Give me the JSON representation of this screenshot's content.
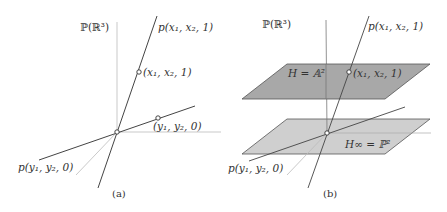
{
  "colors": {
    "line_dark": "#444444",
    "line_light": "#bbbbbb",
    "plane_upper": "#a8a8a8",
    "plane_lower": "#cfcfcf",
    "plane_edge": "#555555"
  },
  "panel_a": {
    "space_label": "ℙ(ℝ³)",
    "line_point_label": "p(x₁, x₂, 1)",
    "point_label": "(x₁, x₂, 1)",
    "point_inf_label": "(y₁, y₂, 0)",
    "line_inf_label": "p(y₁, y₂, 0)",
    "caption": "(a)"
  },
  "panel_b": {
    "space_label": "ℙ(ℝ³)",
    "line_point_label": "p(x₁, x₂, 1)",
    "point_label": "(x₁, x₂, 1)",
    "plane_upper_label": "H = 𝔸²",
    "plane_lower_label": "H∞ = ℙ²",
    "line_inf_label": "p(y₁, y₂, 0)",
    "caption": "(b)"
  }
}
